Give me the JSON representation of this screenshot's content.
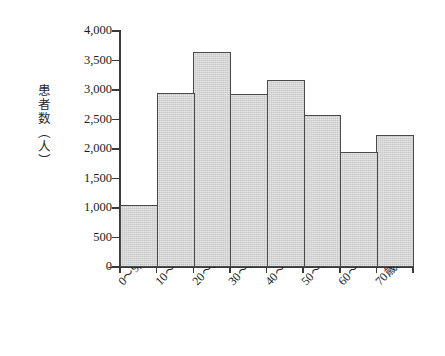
{
  "chart_data": {
    "type": "bar",
    "title": "",
    "subtitle": "",
    "xlabel": "",
    "ylabel": "患者数（人）",
    "categories": [
      "0〜9歳",
      "10〜19歳",
      "20〜29歳",
      "30〜39歳",
      "40〜49歳",
      "50〜59歳",
      "60〜69歳",
      "70歳以上"
    ],
    "values": [
      1050,
      2950,
      3650,
      2930,
      3170,
      2580,
      1950,
      2230
    ],
    "ylim": [
      0,
      4000
    ],
    "ytick_values": [
      0,
      500,
      1000,
      1500,
      2000,
      2500,
      3000,
      3500,
      4000
    ],
    "ytick_labels": [
      "0",
      "500",
      "1,000",
      "1,500",
      "2,000",
      "2,500",
      "3,000",
      "3,500",
      "4,000"
    ],
    "grid": false,
    "legend": null,
    "legend_position": "none",
    "bar_fill_color": "#c6c6c6",
    "bar_border_color": "#4a4a4a",
    "axis_color": "#3a3a3a",
    "background_color": "#ffffff",
    "annotations": []
  }
}
